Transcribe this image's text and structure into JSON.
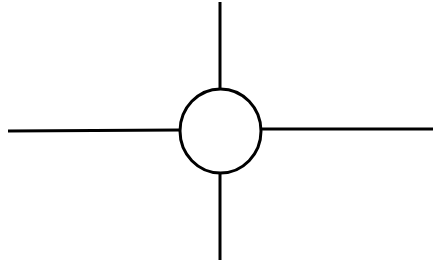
{
  "diagram": {
    "type": "crosshair-circle-symbol",
    "background": "#ffffff",
    "stroke_color": "#000000",
    "stroke_width": 3,
    "circle": {
      "cx": 220.5,
      "cy": 131,
      "rx": 40.5,
      "ry": 42,
      "fill": "#ffffff"
    },
    "lines": [
      {
        "name": "line-top",
        "x1": 220,
        "y1": 2,
        "x2": 220,
        "y2": 89
      },
      {
        "name": "line-bottom",
        "x1": 220,
        "y1": 173,
        "x2": 220,
        "y2": 260
      },
      {
        "name": "line-left",
        "x1": 8,
        "y1": 131,
        "x2": 180,
        "y2": 130
      },
      {
        "name": "line-right",
        "x1": 261,
        "y1": 129,
        "x2": 433,
        "y2": 129
      }
    ]
  }
}
